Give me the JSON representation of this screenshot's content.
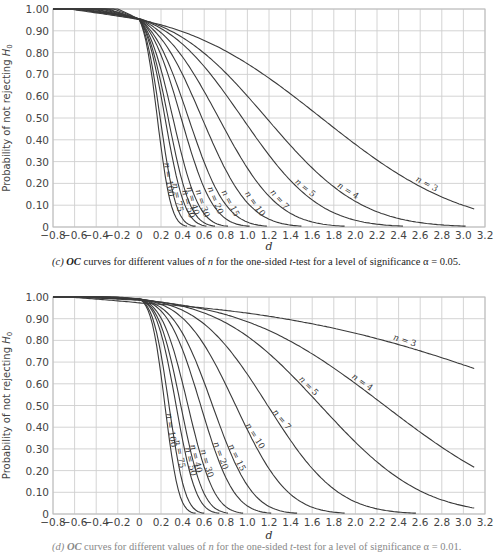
{
  "chart_data": [
    {
      "type": "line",
      "title": "",
      "caption_prefix": "(c)",
      "caption": "OC curves for different values of n for the one-sided t-test for a level of significance α = 0.05.",
      "alpha": 0.05,
      "xlabel": "d",
      "ylabel": "Probability of not rejecting H0",
      "xlim": [
        -0.8,
        3.2
      ],
      "ylim": [
        0,
        1.0
      ],
      "grid": true,
      "x_ticks": [
        "-0.8",
        "-0.6",
        "-0.4",
        "-0.2",
        "0",
        "0.2",
        "0.4",
        "0.6",
        "0.8",
        "1.0",
        "1.2",
        "1.4",
        "1.6",
        "1.8",
        "2.0",
        "2.2",
        "2.4",
        "2.6",
        "2.8",
        "3.0",
        "3.2"
      ],
      "y_ticks": [
        "0",
        "0.10",
        "0.20",
        "0.30",
        "0.40",
        "0.50",
        "0.60",
        "0.70",
        "0.80",
        "0.90",
        "1.00"
      ],
      "series": [
        {
          "name": "n = 3",
          "n": 3,
          "t_crit": 2.92,
          "label_d": 2.65,
          "label_rot": 28
        },
        {
          "name": "n = 4",
          "n": 4,
          "t_crit": 2.353,
          "label_d": 1.92,
          "label_rot": 32
        },
        {
          "name": "n = 5",
          "n": 5,
          "t_crit": 2.132,
          "label_d": 1.52,
          "label_rot": 40
        },
        {
          "name": "n = 7",
          "n": 7,
          "t_crit": 1.943,
          "label_d": 1.28,
          "label_rot": 48
        },
        {
          "name": "n = 10",
          "n": 10,
          "t_crit": 1.833,
          "label_d": 1.05,
          "label_rot": 55
        },
        {
          "name": "n = 15",
          "n": 15,
          "t_crit": 1.761,
          "label_d": 0.82,
          "label_rot": 62
        },
        {
          "name": "n = 20",
          "n": 20,
          "t_crit": 1.729,
          "label_d": 0.68,
          "label_rot": 68
        },
        {
          "name": "n = 30",
          "n": 30,
          "t_crit": 1.699,
          "label_d": 0.56,
          "label_rot": 72
        },
        {
          "name": "n = 40",
          "n": 40,
          "t_crit": 1.685,
          "label_d": 0.47,
          "label_rot": 75
        },
        {
          "name": "n = 50",
          "n": 50,
          "t_crit": 1.677,
          "label_d": 0.43,
          "label_rot": 76
        },
        {
          "name": "n = 75",
          "n": 75,
          "t_crit": 1.666,
          "label_d": 0.33,
          "label_rot": 79
        },
        {
          "name": "n = 100",
          "n": 100,
          "t_crit": 1.66,
          "label_d": 0.25,
          "label_rot": 82
        }
      ]
    },
    {
      "type": "line",
      "title": "",
      "caption_prefix": "(d)",
      "caption": "OC curves for different values of n for the one-sided t-test for a level of significance α = 0.01.",
      "alpha": 0.01,
      "xlabel": "d",
      "ylabel": "Probability of not rejecting H0",
      "xlim": [
        -0.8,
        3.2
      ],
      "ylim": [
        0,
        1.0
      ],
      "grid": true,
      "x_ticks": [
        "-0.8",
        "-0.6",
        "-0.4",
        "-0.2",
        "0",
        "0.2",
        "0.4",
        "0.6",
        "0.8",
        "1.0",
        "1.2",
        "1.4",
        "1.6",
        "1.8",
        "2.0",
        "2.2",
        "2.4",
        "2.6",
        "2.8",
        "3.0",
        "3.2"
      ],
      "y_ticks": [
        "0",
        "0.10",
        "0.20",
        "0.30",
        "0.40",
        "0.50",
        "0.60",
        "0.70",
        "0.80",
        "0.90",
        "1.00"
      ],
      "series": [
        {
          "name": "n = 3",
          "n": 3,
          "t_crit": 6.965,
          "label_d": 2.45,
          "label_rot": 18
        },
        {
          "name": "n = 4",
          "n": 4,
          "t_crit": 4.541,
          "label_d": 2.05,
          "label_rot": 35
        },
        {
          "name": "n = 5",
          "n": 5,
          "t_crit": 3.747,
          "label_d": 1.55,
          "label_rot": 45
        },
        {
          "name": "n = 7",
          "n": 7,
          "t_crit": 3.143,
          "label_d": 1.3,
          "label_rot": 50
        },
        {
          "name": "n = 10",
          "n": 10,
          "t_crit": 2.821,
          "label_d": 1.05,
          "label_rot": 58
        },
        {
          "name": "n = 15",
          "n": 15,
          "t_crit": 2.624,
          "label_d": 0.88,
          "label_rot": 64
        },
        {
          "name": "n = 20",
          "n": 20,
          "t_crit": 2.539,
          "label_d": 0.73,
          "label_rot": 70
        },
        {
          "name": "n = 30",
          "n": 30,
          "t_crit": 2.462,
          "label_d": 0.6,
          "label_rot": 74
        },
        {
          "name": "n = 40",
          "n": 40,
          "t_crit": 2.426,
          "label_d": 0.5,
          "label_rot": 76
        },
        {
          "name": "n = 50",
          "n": 50,
          "t_crit": 2.405,
          "label_d": 0.45,
          "label_rot": 77
        },
        {
          "name": "n = 75",
          "n": 75,
          "t_crit": 2.377,
          "label_d": 0.35,
          "label_rot": 80
        },
        {
          "name": "n = 100",
          "n": 100,
          "t_crit": 2.365,
          "label_d": 0.27,
          "label_rot": 82
        }
      ]
    }
  ],
  "captions": {
    "top_prefix": "(c)",
    "top_text_1": " OC",
    "top_text_2": " curves for different values of ",
    "top_text_3": "n",
    "top_text_4": " for the one-sided ",
    "top_text_5": "t",
    "top_text_6": "-test for a level of significance α = 0.05.",
    "bottom_prefix": "(d)",
    "bottom_text_1": " OC",
    "bottom_text_2": " curves for different values of ",
    "bottom_text_3": "n",
    "bottom_text_4": " for the one-sided ",
    "bottom_text_5": "t",
    "bottom_text_6": "-test for a level of significance α = 0.01."
  }
}
